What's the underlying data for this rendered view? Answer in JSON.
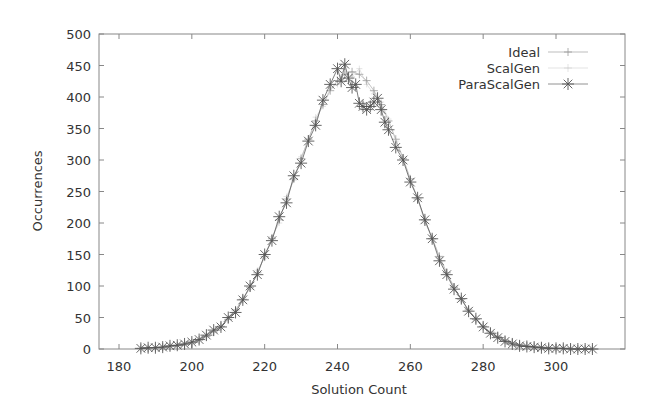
{
  "chart_data": {
    "type": "line",
    "title": "",
    "xlabel": "Solution Count",
    "ylabel": "Occurrences",
    "xlim": [
      175,
      315
    ],
    "ylim": [
      0,
      500
    ],
    "x_ticks": [
      180,
      200,
      220,
      240,
      260,
      280,
      300
    ],
    "y_ticks": [
      0,
      50,
      100,
      150,
      200,
      250,
      300,
      350,
      400,
      450,
      500
    ],
    "grid": false,
    "legend_position": "top-right",
    "series": [
      {
        "name": "Ideal",
        "marker": "plus",
        "color": "#999999",
        "x": [
          186,
          188,
          190,
          192,
          194,
          196,
          198,
          200,
          202,
          204,
          206,
          208,
          210,
          212,
          214,
          216,
          218,
          220,
          222,
          224,
          226,
          228,
          230,
          232,
          234,
          236,
          238,
          240,
          242,
          244,
          246,
          248,
          250,
          252,
          254,
          256,
          258,
          260,
          262,
          264,
          266,
          268,
          270,
          272,
          274,
          276,
          278,
          280,
          282,
          284,
          286,
          288,
          290,
          292,
          294,
          296,
          298,
          300,
          302,
          304,
          306,
          308,
          310
        ],
        "y": [
          1,
          1,
          2,
          3,
          4,
          5,
          7,
          10,
          14,
          20,
          27,
          36,
          47,
          62,
          79,
          98,
          121,
          147,
          175,
          205,
          238,
          270,
          302,
          333,
          362,
          388,
          410,
          426,
          436,
          440,
          436,
          426,
          410,
          388,
          362,
          333,
          302,
          270,
          238,
          205,
          175,
          147,
          121,
          98,
          79,
          62,
          47,
          36,
          27,
          20,
          14,
          10,
          7,
          5,
          4,
          3,
          2,
          1,
          1,
          1,
          0,
          0,
          0
        ]
      },
      {
        "name": "ScalGen",
        "marker": "dot",
        "color": "#bbbbbb",
        "x": [
          186,
          188,
          190,
          192,
          194,
          196,
          198,
          200,
          202,
          204,
          206,
          208,
          210,
          212,
          214,
          216,
          218,
          220,
          222,
          224,
          226,
          228,
          230,
          232,
          234,
          236,
          238,
          240,
          242,
          244,
          246,
          248,
          250,
          252,
          254,
          256,
          258,
          260,
          262,
          264,
          266,
          268,
          270,
          272,
          274,
          276,
          278,
          280,
          282,
          284,
          286,
          288,
          290,
          292,
          294,
          296,
          298,
          300,
          302,
          304,
          306,
          308,
          310
        ],
        "y": [
          0,
          1,
          2,
          2,
          4,
          6,
          8,
          9,
          15,
          18,
          29,
          34,
          49,
          60,
          82,
          95,
          125,
          144,
          178,
          200,
          242,
          268,
          305,
          330,
          368,
          385,
          415,
          420,
          440,
          432,
          445,
          420,
          405,
          392,
          365,
          330,
          305,
          268,
          240,
          200,
          178,
          145,
          118,
          100,
          76,
          64,
          45,
          37,
          26,
          21,
          13,
          11,
          6,
          5,
          3,
          2,
          2,
          1,
          1,
          0,
          0,
          0,
          0
        ]
      },
      {
        "name": "ParaScalGen",
        "marker": "star",
        "color": "#555555",
        "x": [
          186,
          188,
          190,
          192,
          194,
          196,
          198,
          200,
          202,
          204,
          206,
          208,
          210,
          212,
          214,
          216,
          218,
          220,
          222,
          224,
          226,
          228,
          230,
          232,
          234,
          236,
          238,
          240,
          241,
          242,
          243,
          244,
          245,
          246,
          247,
          248,
          249,
          250,
          251,
          252,
          253,
          254,
          256,
          258,
          260,
          262,
          264,
          266,
          268,
          270,
          272,
          274,
          276,
          278,
          280,
          282,
          284,
          286,
          288,
          290,
          292,
          294,
          296,
          298,
          300,
          302,
          304,
          306,
          308,
          310
        ],
        "y": [
          1,
          2,
          2,
          3,
          5,
          6,
          8,
          11,
          15,
          22,
          30,
          35,
          50,
          58,
          78,
          100,
          118,
          150,
          172,
          210,
          232,
          275,
          295,
          330,
          355,
          395,
          420,
          445,
          425,
          452,
          430,
          415,
          420,
          390,
          385,
          380,
          385,
          392,
          398,
          380,
          360,
          348,
          320,
          300,
          265,
          240,
          205,
          175,
          140,
          118,
          95,
          80,
          60,
          48,
          35,
          25,
          18,
          12,
          8,
          5,
          4,
          3,
          2,
          1,
          1,
          1,
          0,
          0,
          0,
          0
        ]
      }
    ]
  },
  "legend": {
    "items": [
      {
        "label": "Ideal"
      },
      {
        "label": "ScalGen"
      },
      {
        "label": "ParaScalGen"
      }
    ]
  },
  "axes": {
    "xlabel": "Solution Count",
    "ylabel": "Occurrences"
  }
}
